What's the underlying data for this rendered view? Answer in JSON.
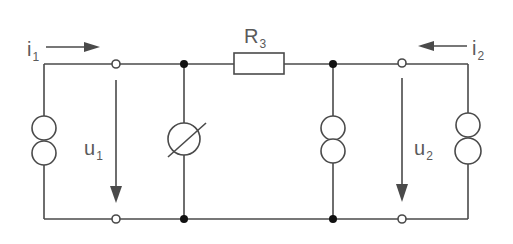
{
  "diagram": {
    "type": "two-port circuit",
    "colors": {
      "wire": "#4a4a4a",
      "label": "#5a5a5a",
      "background": "#ffffff"
    },
    "labels": {
      "i1": {
        "main": "i",
        "sub": "1"
      },
      "i2": {
        "main": "i",
        "sub": "2"
      },
      "u1": {
        "main": "u",
        "sub": "1"
      },
      "u2": {
        "main": "u",
        "sub": "2"
      },
      "r3": {
        "main": "R",
        "sub": "3"
      }
    },
    "components": [
      {
        "id": "left-current-source",
        "kind": "current-source"
      },
      {
        "id": "left-port-terminals",
        "kind": "terminal-pair"
      },
      {
        "id": "variable-element",
        "kind": "circle-with-slash"
      },
      {
        "id": "r3",
        "kind": "resistor",
        "label": "R3"
      },
      {
        "id": "middle-current-source",
        "kind": "current-source"
      },
      {
        "id": "right-port-terminals",
        "kind": "terminal-pair"
      },
      {
        "id": "right-current-source",
        "kind": "current-source"
      }
    ]
  }
}
